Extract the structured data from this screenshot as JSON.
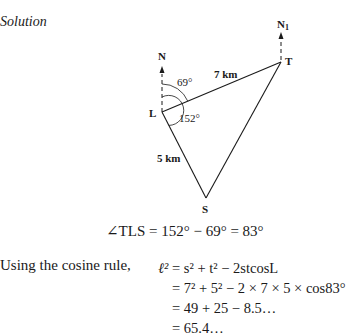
{
  "heading": "Solution",
  "diagram": {
    "points": {
      "L": {
        "label": "L",
        "x": 162,
        "y": 112
      },
      "T": {
        "label": "T",
        "x": 281,
        "y": 62
      },
      "S": {
        "label": "S",
        "x": 206,
        "y": 198
      }
    },
    "north_L": "N",
    "north_T": "N",
    "north_T_sub": "1",
    "side_LT": "7 km",
    "side_LS": "5 km",
    "angle_small": "69°",
    "angle_large": "152°"
  },
  "angle_equation": "∠TLS = 152° − 69° = 83°",
  "intro_text": "Using the cosine rule,",
  "cosine_rule": {
    "line1_lhs": "ℓ²",
    "line1": "= s² + t² − 2stcosL",
    "line2": "= 7² + 5² − 2 × 7 × 5 × cos83°",
    "line3": "= 49 + 25 − 8.5…",
    "line4": "= 65.4…"
  }
}
